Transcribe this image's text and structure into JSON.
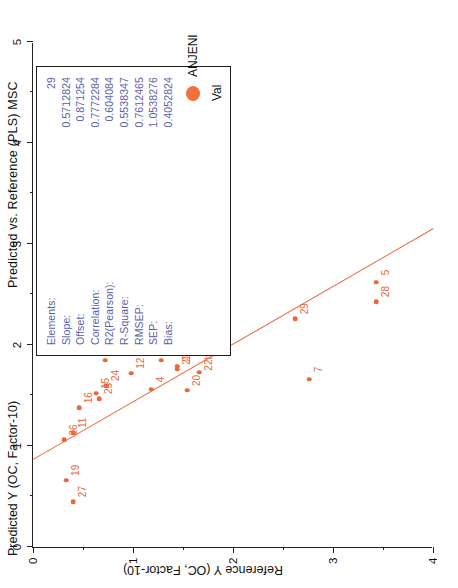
{
  "chart_data": {
    "type": "scatter",
    "title": "Predicted vs. Reference (PLS) MSC",
    "xlabel": "Reference Y (OC, Factor-10)",
    "ylabel": "Predicted Y (OC, Factor-10)",
    "xlim": [
      0,
      4
    ],
    "ylim": [
      0,
      5
    ],
    "xticks": [
      "0",
      "1",
      "2",
      "3",
      "4"
    ],
    "yticks": [
      "0",
      "1",
      "2",
      "3",
      "4",
      "5"
    ],
    "grid": false,
    "legend_position": "bottom-right",
    "legend": [
      {
        "label": "ANJENI",
        "marker": "filled-circle",
        "color": "#f2703c"
      }
    ],
    "legend_sublabel": "Val",
    "point_color": "#e8693c",
    "fit_line_color": "#ea6f42",
    "points": [
      {
        "label": "19",
        "x": 0.33,
        "y": 0.66
      },
      {
        "label": "27",
        "x": 0.4,
        "y": 0.45
      },
      {
        "label": "26",
        "x": 0.31,
        "y": 1.06
      },
      {
        "label": "11",
        "x": 0.4,
        "y": 1.13
      },
      {
        "label": "16",
        "x": 0.46,
        "y": 1.38
      },
      {
        "label": "15",
        "x": 0.63,
        "y": 1.52
      },
      {
        "label": "25",
        "x": 0.66,
        "y": 1.47
      },
      {
        "label": "24",
        "x": 0.73,
        "y": 1.6
      },
      {
        "label": "10",
        "x": 0.72,
        "y": 1.85
      },
      {
        "label": "6",
        "x": 0.95,
        "y": 2.15
      },
      {
        "label": "12",
        "x": 0.98,
        "y": 1.72
      },
      {
        "label": "4",
        "x": 1.18,
        "y": 1.56
      },
      {
        "label": "13",
        "x": 1.28,
        "y": 1.85
      },
      {
        "label": "21",
        "x": 1.44,
        "y": 1.79
      },
      {
        "label": "22",
        "x": 1.44,
        "y": 1.76
      },
      {
        "label": "20",
        "x": 1.54,
        "y": 1.55
      },
      {
        "label": "22b",
        "x": 1.66,
        "y": 1.73
      },
      {
        "label": "",
        "x": 1.9,
        "y": 1.97
      },
      {
        "label": "29",
        "x": 2.62,
        "y": 2.26
      },
      {
        "label": "7",
        "x": 2.76,
        "y": 1.66
      },
      {
        "label": "28",
        "x": 3.43,
        "y": 2.43
      },
      {
        "label": "5",
        "x": 3.43,
        "y": 2.62
      }
    ]
  },
  "title": {
    "text": "Predicted vs. Reference (PLS) MSC"
  },
  "axes": {
    "top_label": "Predicted Y (OC, Factor-10)",
    "left_label": "Reference Y (OC, Factor-10)",
    "top_ticks": [
      "0",
      "1",
      "2",
      "3",
      "4",
      "5"
    ],
    "left_ticks": [
      "0",
      "1",
      "2",
      "3",
      "4"
    ]
  },
  "stats": {
    "rows": [
      {
        "key": "Elements:",
        "value": "29"
      },
      {
        "key": "Slope:",
        "value": "0.5712824"
      },
      {
        "key": "Offset:",
        "value": "0.871254"
      },
      {
        "key": "Correlation:",
        "value": "0.7772284"
      },
      {
        "key": "R2(Pearson):",
        "value": "0.604084"
      },
      {
        "key": "R-Square:",
        "value": "0.5538347"
      },
      {
        "key": "RMSEP:",
        "value": "0.7612465"
      },
      {
        "key": "SEP:",
        "value": "1.0538276"
      },
      {
        "key": "Bias:",
        "value": "0.4052824"
      }
    ]
  },
  "legend": {
    "series_label": "ANJENI",
    "sub_label": "Val"
  },
  "colors": {
    "marker": "#e8693c",
    "legend_marker": "#f2703c",
    "fit_line": "#ea6f42",
    "stats_text": "#5a5fa8",
    "axis": "#222222"
  }
}
